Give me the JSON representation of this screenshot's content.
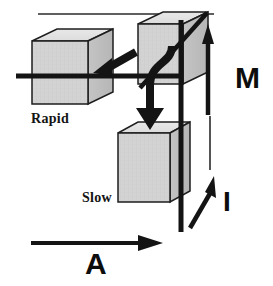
{
  "figure": {
    "background_color": "#ffffff",
    "ink_color": "#111111",
    "cube_face_color": "#d2d2d2",
    "cube_top_color": "#e2e2e2",
    "cube_side_color": "#bdbdbd",
    "cube_edge_color": "#1a1a1a"
  },
  "blocks": [
    {
      "id": "rapid",
      "label": "Rapid",
      "position": "upper-left"
    },
    {
      "id": "top-right",
      "label": "",
      "position": "upper-right"
    },
    {
      "id": "slow",
      "label": "Slow",
      "position": "lower-center"
    }
  ],
  "axes": [
    {
      "id": "m",
      "label": "M",
      "direction": "up",
      "position": "right"
    },
    {
      "id": "i",
      "label": "I",
      "direction": "up-right",
      "position": "lower-right"
    },
    {
      "id": "a",
      "label": "A",
      "direction": "right",
      "position": "bottom"
    }
  ],
  "arrows": [
    {
      "id": "to-rapid",
      "direction": "down-left",
      "from": "top-right-block",
      "to": "rapid-block"
    },
    {
      "id": "to-slow",
      "direction": "curved-down",
      "from": "top-right-block",
      "to": "slow-block"
    }
  ]
}
